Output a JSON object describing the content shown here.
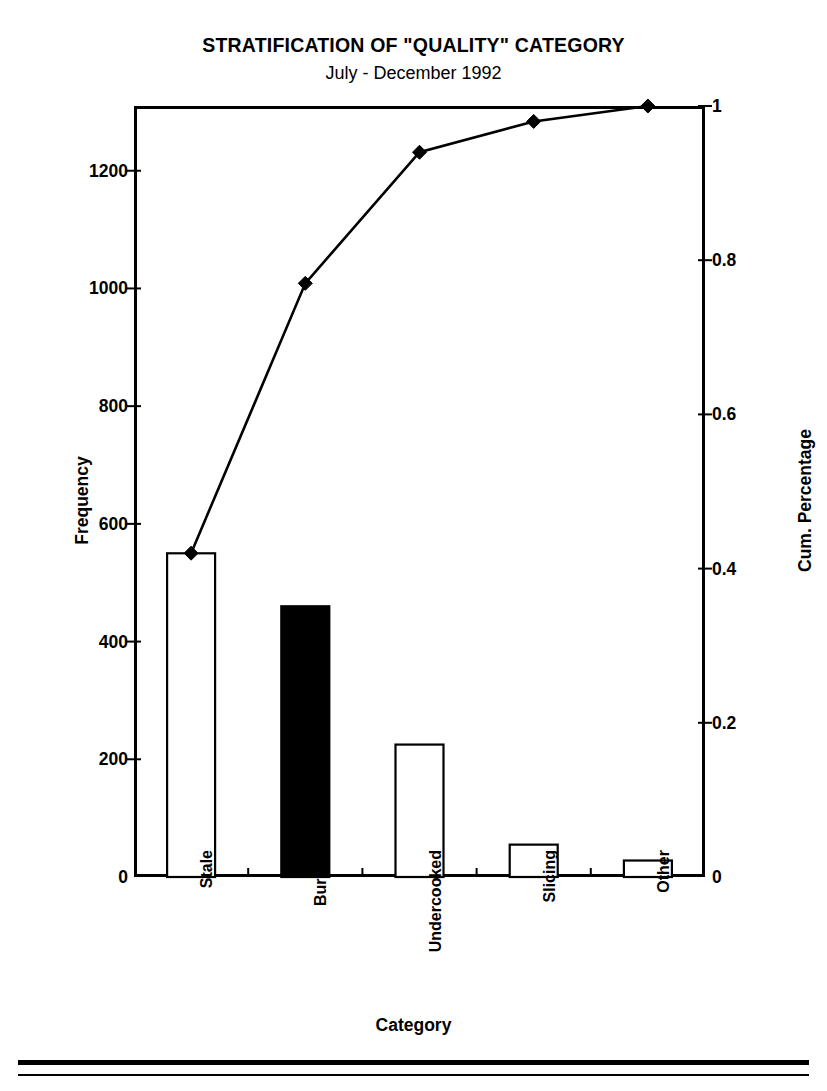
{
  "chart_data": {
    "type": "bar",
    "title": "STRATIFICATION OF \"QUALITY\" CATEGORY",
    "subtitle": "July - December 1992",
    "xlabel": "Category",
    "ylabel": "Frequency",
    "y2label": "Cum. Percentage",
    "categories": [
      "Stale",
      "Burned",
      "Undercooked",
      "Slicing",
      "Other"
    ],
    "values": [
      550,
      460,
      225,
      55,
      28
    ],
    "series": [
      {
        "name": "Frequency",
        "type": "bar",
        "axis": "left",
        "values": [
          550,
          460,
          225,
          55,
          28
        ],
        "bar_fill": [
          "#ffffff",
          "#000000",
          "#ffffff",
          "#ffffff",
          "#ffffff"
        ]
      },
      {
        "name": "Cum. Percentage",
        "type": "line",
        "axis": "right",
        "marker": "diamond",
        "values": [
          0.42,
          0.77,
          0.94,
          0.98,
          1.0
        ]
      }
    ],
    "ylim": [
      0,
      1310
    ],
    "y2lim": [
      0,
      1.0
    ],
    "yticks": [
      0,
      200,
      400,
      600,
      800,
      1000,
      1200
    ],
    "yticklabels": [
      "0",
      "200",
      "400",
      "600",
      "800",
      "1000",
      "1200"
    ],
    "y2ticks": [
      0,
      0.2,
      0.4,
      0.6,
      0.8,
      1
    ],
    "y2ticklabels": [
      "0",
      "0.2",
      "0.4",
      "0.6",
      "0.8",
      "1"
    ],
    "grid": false,
    "legend": "none",
    "colors": {
      "axis": "#000000",
      "line": "#000000",
      "bar_outline": "#000000",
      "bar_fill_open": "#ffffff",
      "bar_fill_solid": "#000000",
      "background": "#ffffff"
    }
  }
}
